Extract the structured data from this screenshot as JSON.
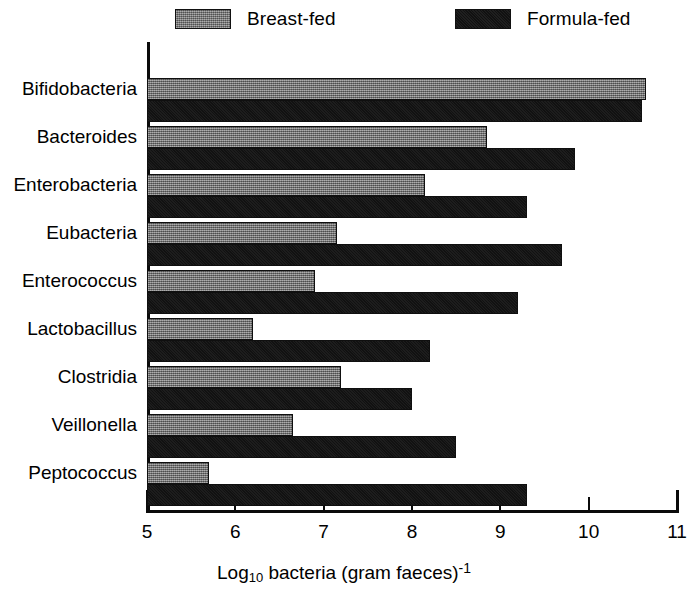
{
  "chart_data": {
    "type": "bar",
    "orientation": "horizontal",
    "title": "",
    "xlabel": "Log10 bacteria (gram faeces)-1",
    "xlabel_parts": {
      "lead": "Log",
      "subscript": "10",
      "mid": " bacteria (gram faeces)",
      "superscript": "-1"
    },
    "ylabel": "",
    "categories": [
      "Bifidobacteria",
      "Bacteroides",
      "Enterobacteria",
      "Eubacteria",
      "Enterococcus",
      "Lactobacillus",
      "Clostridia",
      "Veillonella",
      "Peptococcus"
    ],
    "series": [
      {
        "name": "Breast-fed",
        "color": "#7c7c7c",
        "values": [
          10.65,
          8.85,
          8.15,
          7.15,
          6.9,
          6.2,
          7.2,
          6.65,
          5.7
        ]
      },
      {
        "name": "Formula-fed",
        "color": "#131313",
        "values": [
          10.6,
          9.85,
          9.3,
          9.7,
          9.2,
          8.2,
          8.0,
          8.5,
          9.3
        ]
      }
    ],
    "xticks": [
      5,
      6,
      7,
      8,
      9,
      10,
      11
    ],
    "xtick_labels": [
      "5",
      "6",
      "7",
      "8",
      "9",
      "10",
      "11"
    ],
    "xlim": [
      5,
      11
    ],
    "grid": false,
    "legend_position": "top"
  },
  "legend": {
    "entries": [
      {
        "label": "Breast-fed",
        "swatch": "gray-hatched-swatch"
      },
      {
        "label": "Formula-fed",
        "swatch": "black-swatch"
      }
    ]
  }
}
